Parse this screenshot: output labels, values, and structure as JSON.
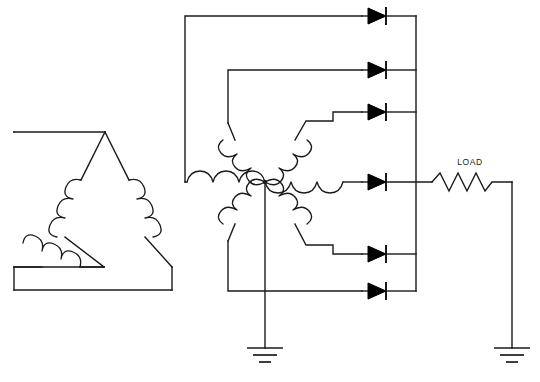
{
  "diagram": {
    "background_color": "#ffffff",
    "line_color": "#1a1a1a",
    "width": 540,
    "height": 382
  },
  "labels": {
    "load": "LOAD"
  },
  "components": {
    "delta_winding": {
      "name": "delta-primary-winding",
      "phase_count": 3,
      "coils": [
        "left-leg-coil",
        "right-leg-coil",
        "bottom-leg-coil"
      ],
      "apex": {
        "x": 105,
        "y": 132
      },
      "bottom_left": {
        "x": 38,
        "y": 267
      },
      "bottom_right": {
        "x": 172,
        "y": 267
      }
    },
    "star_winding": {
      "name": "six-phase-star-secondary",
      "phase_count": 6,
      "center": {
        "x": 265,
        "y": 182
      },
      "coils": [
        {
          "name": "star-coil-1",
          "angle_deg": 150,
          "feeds_diode": 1
        },
        {
          "name": "star-coil-2",
          "angle_deg": 30,
          "feeds_diode": 3
        },
        {
          "name": "star-coil-3",
          "angle_deg": 180,
          "feeds_diode": 2
        },
        {
          "name": "star-coil-4",
          "angle_deg": 0,
          "feeds_diode": 4
        },
        {
          "name": "star-coil-5",
          "angle_deg": 210,
          "feeds_diode": 6
        },
        {
          "name": "star-coil-6",
          "angle_deg": 330,
          "feeds_diode": 5
        }
      ],
      "neutral_to_ground": true
    },
    "diodes": [
      {
        "name": "diode-1",
        "y": 15,
        "orientation": "anode-left-cathode-right"
      },
      {
        "name": "diode-2",
        "y": 70,
        "orientation": "anode-left-cathode-right"
      },
      {
        "name": "diode-3",
        "y": 127,
        "orientation": "anode-left-cathode-right"
      },
      {
        "name": "diode-4",
        "y": 182,
        "orientation": "anode-left-cathode-right"
      },
      {
        "name": "diode-5",
        "y": 237,
        "orientation": "anode-left-cathode-right"
      },
      {
        "name": "diode-6",
        "y": 291,
        "orientation": "anode-left-cathode-right"
      }
    ],
    "dc_bus": {
      "name": "dc-positive-bus",
      "x": 416,
      "y_top": 15,
      "y_bottom": 291
    },
    "load_resistor": {
      "name": "load-resistor",
      "label": "LOAD",
      "x_start": 432,
      "x_end": 500,
      "y": 182,
      "zigzag_peaks": 4
    },
    "return_conductor": {
      "name": "load-return-conductor",
      "x": 512,
      "y_top": 182,
      "y_bottom": 348
    },
    "grounds": [
      {
        "name": "ground-neutral",
        "x": 265,
        "y": 348,
        "bars": 3
      },
      {
        "name": "ground-load-return",
        "x": 512,
        "y": 348,
        "bars": 3
      }
    ],
    "rails": {
      "outer_left_rail": {
        "name": "outer-left-rail",
        "x": 185,
        "y_top": 16,
        "y_bottom": 182
      },
      "inner_left_rail": {
        "name": "inner-left-rail",
        "x": 228,
        "y_top": 70,
        "y_bottom": 182
      },
      "lower_left_rail": {
        "name": "lower-left-rail",
        "x": 228,
        "y_top": 182,
        "y_bottom": 291
      }
    }
  }
}
